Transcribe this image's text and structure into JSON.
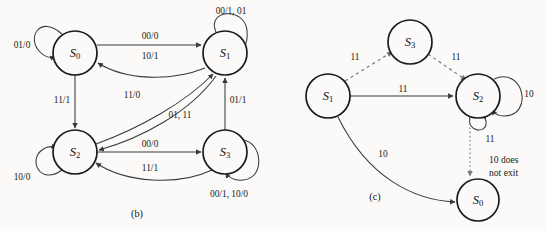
{
  "page": {
    "background_color": "#fbfaf8",
    "ink_color": "#1a1a1a",
    "width": 546,
    "height": 229
  },
  "diagrams": [
    {
      "id": "b",
      "caption": "(b)",
      "caption_pos": {
        "x": 137,
        "y": 213
      },
      "edge_style": "solid",
      "nodes": [
        {
          "id": "S0",
          "label": "S",
          "sub": "0",
          "x": 75,
          "y": 53,
          "r": 22
        },
        {
          "id": "S1",
          "label": "S",
          "sub": "1",
          "x": 225,
          "y": 53,
          "r": 22
        },
        {
          "id": "S2",
          "label": "S",
          "sub": "2",
          "x": 75,
          "y": 152,
          "r": 22
        },
        {
          "id": "S3",
          "label": "S",
          "sub": "3",
          "x": 225,
          "y": 152,
          "r": 22
        }
      ],
      "self_loops": [
        {
          "node": "S0",
          "label": "01/0",
          "label_x": 22,
          "label_y": 45,
          "side": "upper-left"
        },
        {
          "node": "S1",
          "label": "00/1, 01",
          "label_x": 231,
          "label_y": 11,
          "side": "upper-right"
        },
        {
          "node": "S2",
          "label": "10/0",
          "label_x": 22,
          "label_y": 177,
          "side": "lower-left"
        },
        {
          "node": "S3",
          "label": "00/1, 10/0",
          "label_x": 229,
          "label_y": 194,
          "side": "lower-right"
        }
      ],
      "edges": [
        {
          "from": "S0",
          "to": "S1",
          "label": "00/0",
          "label_x": 150,
          "label_y": 36,
          "shape": "straight"
        },
        {
          "from": "S1",
          "to": "S0",
          "label": "10/1",
          "label_x": 150,
          "label_y": 56,
          "shape": "curved"
        },
        {
          "from": "S0",
          "to": "S2",
          "label": "11/1",
          "label_x": 62,
          "label_y": 100,
          "shape": "straight"
        },
        {
          "from": "S2",
          "to": "S1",
          "label": "11/0",
          "label_x": 132,
          "label_y": 95,
          "shape": "curved"
        },
        {
          "from": "S1",
          "to": "S2",
          "label": "01, 11",
          "label_x": 180,
          "label_y": 115,
          "shape": "curved"
        },
        {
          "from": "S3",
          "to": "S1",
          "label": "01/1",
          "label_x": 238,
          "label_y": 100,
          "shape": "straight"
        },
        {
          "from": "S2",
          "to": "S3",
          "label": "00/0",
          "label_x": 150,
          "label_y": 144,
          "shape": "straight"
        },
        {
          "from": "S3",
          "to": "S2",
          "label": "11/1",
          "label_x": 150,
          "label_y": 168,
          "shape": "curved"
        }
      ]
    },
    {
      "id": "c",
      "caption": "(c)",
      "caption_pos": {
        "x": 375,
        "y": 196
      },
      "edge_style": "mixed",
      "nodes": [
        {
          "id": "S3",
          "label": "S",
          "sub": "3",
          "x": 410,
          "y": 42,
          "r": 22
        },
        {
          "id": "S1",
          "label": "S",
          "sub": "1",
          "x": 328,
          "y": 96,
          "r": 22
        },
        {
          "id": "S2",
          "label": "S",
          "sub": "2",
          "x": 478,
          "y": 96,
          "r": 22
        },
        {
          "id": "S0",
          "label": "S",
          "sub": "0",
          "x": 478,
          "y": 200,
          "r": 21
        }
      ],
      "self_loops": [
        {
          "node": "S2",
          "label": "10",
          "label_x": 529,
          "label_y": 94,
          "side": "right"
        },
        {
          "node": "S2",
          "label": "11",
          "label_x": 490,
          "label_y": 135,
          "side": "bottom"
        }
      ],
      "edges": [
        {
          "from": "S1",
          "to": "S3",
          "label": "11",
          "label_x": 355,
          "label_y": 57,
          "style": "dashed",
          "shape": "straight"
        },
        {
          "from": "S3",
          "to": "S2",
          "label": "11",
          "label_x": 456,
          "label_y": 57,
          "style": "dashed",
          "shape": "straight"
        },
        {
          "from": "S1",
          "to": "S2",
          "label": "11",
          "label_x": 403,
          "label_y": 89,
          "style": "solid",
          "shape": "straight"
        },
        {
          "from": "S1",
          "to": "S0",
          "label": "10",
          "label_x": 383,
          "label_y": 154,
          "style": "solid",
          "shape": "curved"
        },
        {
          "from": "S2",
          "to": "S0",
          "label": "",
          "label_x": 0,
          "label_y": 0,
          "style": "dotted",
          "shape": "straight"
        }
      ],
      "notes": [
        {
          "line1": "10 does",
          "line2": "not exit",
          "x": 489,
          "y": 159
        }
      ]
    }
  ]
}
